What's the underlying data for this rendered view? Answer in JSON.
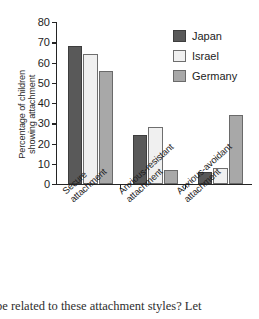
{
  "chart_data": {
    "type": "bar",
    "title": "",
    "xlabel": "",
    "ylabel": "Percentage of children\nshowing attachment",
    "ylim": [
      0,
      80
    ],
    "yticks": [
      0,
      10,
      20,
      30,
      40,
      50,
      60,
      70,
      80
    ],
    "grid": false,
    "legend_position": "top-right",
    "categories": [
      "Secure\nattachment",
      "Anxious-resistant\nattachment",
      "Anxious-avoidant\nattachment"
    ],
    "series": [
      {
        "name": "Japan",
        "color": "#595959",
        "values": [
          68,
          24,
          6
        ]
      },
      {
        "name": "Israel",
        "color": "#f0f0f0",
        "values": [
          64,
          28,
          8
        ]
      },
      {
        "name": "Germany",
        "color": "#a8a8a8",
        "values": [
          56,
          7,
          34
        ]
      }
    ]
  },
  "caption": {
    "line1": "be related to these attachment styles? Let"
  }
}
